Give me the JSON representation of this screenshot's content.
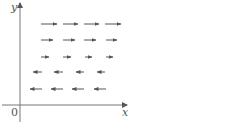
{
  "diagram": {
    "type": "vector-field",
    "axes": {
      "x_label": "x",
      "y_label": "y",
      "origin_label": "0",
      "color": "#777777"
    },
    "arrow_color": "#555555",
    "rows": [
      {
        "y": 24,
        "direction": "right",
        "arrows": [
          [
            41,
            57
          ],
          [
            63,
            78
          ],
          [
            84,
            99
          ],
          [
            105,
            121
          ]
        ]
      },
      {
        "y": 40,
        "direction": "right",
        "arrows": [
          [
            41,
            53
          ],
          [
            63,
            75
          ],
          [
            84,
            96
          ],
          [
            106,
            117
          ]
        ]
      },
      {
        "y": 57,
        "direction": "right",
        "arrows": [
          [
            41,
            49
          ],
          [
            63,
            71
          ],
          [
            85,
            92
          ],
          [
            106,
            113
          ]
        ]
      },
      {
        "y": 72,
        "direction": "left",
        "arrows": [
          [
            33,
            42
          ],
          [
            54,
            63
          ],
          [
            76,
            84
          ],
          [
            97,
            105
          ]
        ]
      },
      {
        "y": 89,
        "direction": "left",
        "arrows": [
          [
            30,
            42
          ],
          [
            51,
            63
          ],
          [
            72,
            84
          ],
          [
            94,
            106
          ]
        ]
      }
    ]
  }
}
